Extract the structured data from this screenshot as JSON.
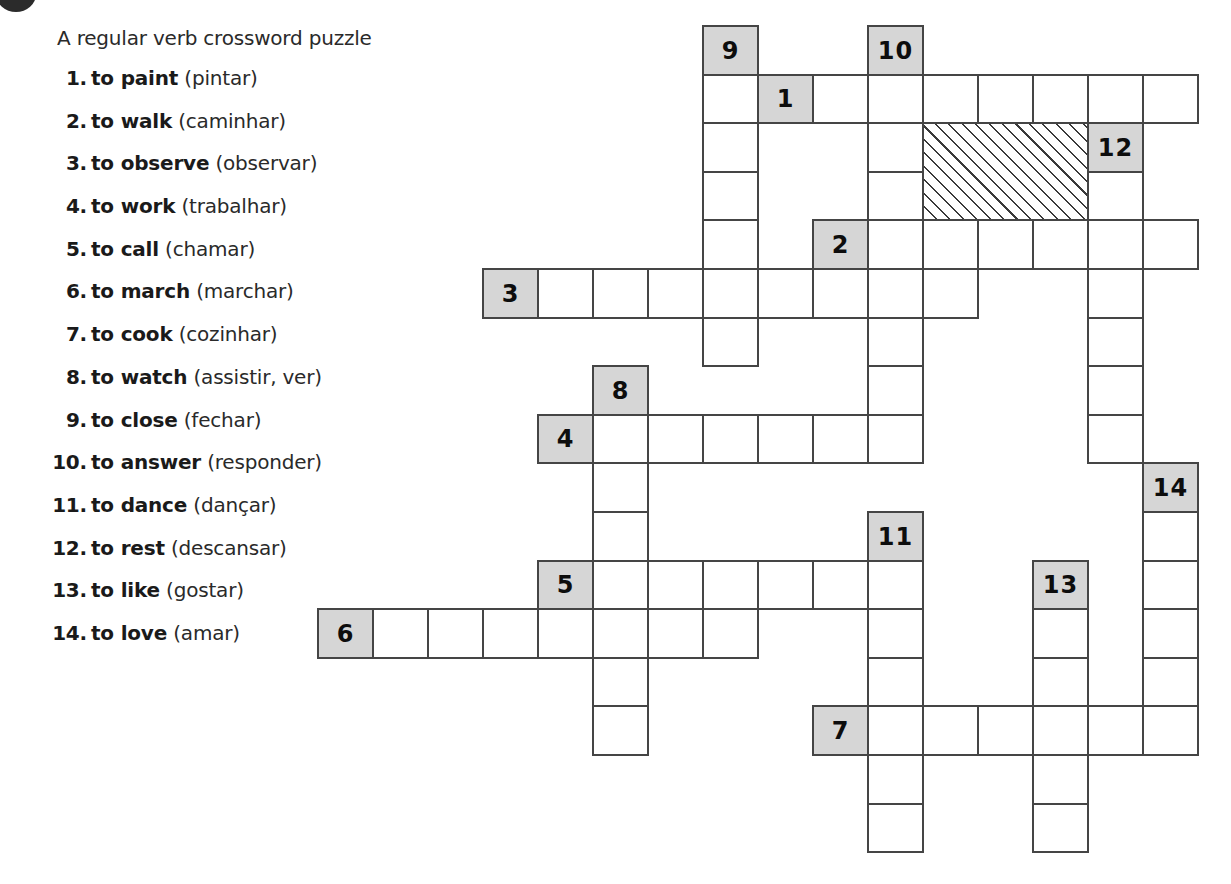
{
  "page": {
    "title": "A regular verb crossword puzzle"
  },
  "clues": [
    {
      "num": "1.",
      "en": "to paint",
      "pt": "(pintar)"
    },
    {
      "num": "2.",
      "en": "to walk",
      "pt": "(caminhar)"
    },
    {
      "num": "3.",
      "en": "to observe",
      "pt": "(observar)"
    },
    {
      "num": "4.",
      "en": "to work",
      "pt": "(trabalhar)"
    },
    {
      "num": "5.",
      "en": "to call",
      "pt": "(chamar)"
    },
    {
      "num": "6.",
      "en": "to march",
      "pt": "(marchar)"
    },
    {
      "num": "7.",
      "en": "to cook",
      "pt": "(cozinhar)"
    },
    {
      "num": "8.",
      "en": "to watch",
      "pt": "(assistir, ver)"
    },
    {
      "num": "9.",
      "en": "to close",
      "pt": "(fechar)"
    },
    {
      "num": "10.",
      "en": "to answer",
      "pt": "(responder)"
    },
    {
      "num": "11.",
      "en": "to dance",
      "pt": "(dançar)"
    },
    {
      "num": "12.",
      "en": "to rest",
      "pt": "(descansar)"
    },
    {
      "num": "13.",
      "en": "to like",
      "pt": "(gostar)"
    },
    {
      "num": "14.",
      "en": "to love",
      "pt": "(amar)"
    }
  ],
  "grid": {
    "origin_x": 317,
    "origin_y": 25,
    "cell_w": 55,
    "cell_h": 48.6,
    "colors": {
      "label_fill": "#d6d6d6",
      "border": "#454545",
      "cell_fill": "#ffffff"
    },
    "entries": [
      {
        "number": "1",
        "direction": "across",
        "label": [
          8,
          1
        ],
        "cells": [
          [
            9,
            1
          ],
          [
            10,
            1
          ],
          [
            11,
            1
          ],
          [
            12,
            1
          ],
          [
            13,
            1
          ],
          [
            14,
            1
          ],
          [
            15,
            1
          ]
        ]
      },
      {
        "number": "2",
        "direction": "across",
        "label": [
          9,
          4
        ],
        "cells": [
          [
            10,
            4
          ],
          [
            11,
            4
          ],
          [
            12,
            4
          ],
          [
            13,
            4
          ],
          [
            14,
            4
          ],
          [
            15,
            4
          ]
        ]
      },
      {
        "number": "3",
        "direction": "across",
        "label": [
          3,
          5
        ],
        "cells": [
          [
            4,
            5
          ],
          [
            5,
            5
          ],
          [
            6,
            5
          ],
          [
            7,
            5
          ],
          [
            8,
            5
          ],
          [
            9,
            5
          ],
          [
            10,
            5
          ],
          [
            11,
            5
          ]
        ]
      },
      {
        "number": "4",
        "direction": "across",
        "label": [
          4,
          8
        ],
        "cells": [
          [
            5,
            8
          ],
          [
            6,
            8
          ],
          [
            7,
            8
          ],
          [
            8,
            8
          ],
          [
            9,
            8
          ],
          [
            10,
            8
          ]
        ]
      },
      {
        "number": "5",
        "direction": "across",
        "label": [
          4,
          11
        ],
        "cells": [
          [
            5,
            11
          ],
          [
            6,
            11
          ],
          [
            7,
            11
          ],
          [
            8,
            11
          ],
          [
            9,
            11
          ],
          [
            10,
            11
          ]
        ]
      },
      {
        "number": "6",
        "direction": "across",
        "label": [
          0,
          12
        ],
        "cells": [
          [
            1,
            12
          ],
          [
            2,
            12
          ],
          [
            3,
            12
          ],
          [
            4,
            12
          ],
          [
            5,
            12
          ],
          [
            6,
            12
          ],
          [
            7,
            12
          ]
        ]
      },
      {
        "number": "7",
        "direction": "across",
        "label": [
          9,
          14
        ],
        "cells": [
          [
            10,
            14
          ],
          [
            11,
            14
          ],
          [
            12,
            14
          ],
          [
            13,
            14
          ],
          [
            14,
            14
          ],
          [
            15,
            14
          ]
        ]
      },
      {
        "number": "8",
        "direction": "down",
        "label": [
          5,
          7
        ],
        "cells": [
          [
            5,
            8
          ],
          [
            5,
            9
          ],
          [
            5,
            10
          ],
          [
            5,
            11
          ],
          [
            5,
            12
          ],
          [
            5,
            13
          ],
          [
            5,
            14
          ]
        ]
      },
      {
        "number": "9",
        "direction": "down",
        "label": [
          7,
          0
        ],
        "cells": [
          [
            7,
            1
          ],
          [
            7,
            2
          ],
          [
            7,
            3
          ],
          [
            7,
            4
          ],
          [
            7,
            5
          ],
          [
            7,
            6
          ]
        ]
      },
      {
        "number": "10",
        "direction": "down",
        "label": [
          10,
          0
        ],
        "cells": [
          [
            10,
            1
          ],
          [
            10,
            2
          ],
          [
            10,
            3
          ],
          [
            10,
            4
          ],
          [
            10,
            5
          ],
          [
            10,
            6
          ],
          [
            10,
            7
          ],
          [
            10,
            8
          ]
        ]
      },
      {
        "number": "11",
        "direction": "down",
        "label": [
          10,
          10
        ],
        "cells": [
          [
            10,
            11
          ],
          [
            10,
            12
          ],
          [
            10,
            13
          ],
          [
            10,
            14
          ],
          [
            10,
            15
          ],
          [
            10,
            16
          ]
        ]
      },
      {
        "number": "12",
        "direction": "down",
        "label": [
          14,
          2
        ],
        "cells": [
          [
            14,
            3
          ],
          [
            14,
            4
          ],
          [
            14,
            5
          ],
          [
            14,
            6
          ],
          [
            14,
            7
          ],
          [
            14,
            8
          ]
        ]
      },
      {
        "number": "13",
        "direction": "down",
        "label": [
          13,
          11
        ],
        "cells": [
          [
            13,
            12
          ],
          [
            13,
            13
          ],
          [
            13,
            14
          ],
          [
            13,
            15
          ],
          [
            13,
            16
          ]
        ]
      },
      {
        "number": "14",
        "direction": "down",
        "label": [
          15,
          9
        ],
        "cells": [
          [
            15,
            10
          ],
          [
            15,
            11
          ],
          [
            15,
            12
          ],
          [
            15,
            13
          ],
          [
            15,
            14
          ]
        ]
      }
    ],
    "hatched_block": {
      "col": 11,
      "row": 2,
      "cols": 3,
      "rows": 2
    }
  }
}
